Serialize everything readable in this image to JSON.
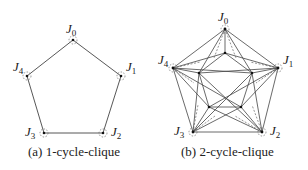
{
  "figures": [
    {
      "id": "a",
      "caption": "(a) 1-cycle-clique",
      "nodes": [
        {
          "name": "J",
          "sub": "0"
        },
        {
          "name": "J",
          "sub": "1"
        },
        {
          "name": "J",
          "sub": "2"
        },
        {
          "name": "J",
          "sub": "3"
        },
        {
          "name": "J",
          "sub": "4"
        }
      ]
    },
    {
      "id": "b",
      "caption": "(b) 2-cycle-clique",
      "nodes": [
        {
          "name": "J",
          "sub": "0"
        },
        {
          "name": "J",
          "sub": "1"
        },
        {
          "name": "J",
          "sub": "2"
        },
        {
          "name": "J",
          "sub": "3"
        },
        {
          "name": "J",
          "sub": "4"
        }
      ]
    }
  ],
  "colors": {
    "edge": "#333333",
    "dashed": "#555555",
    "text": "#222222"
  }
}
